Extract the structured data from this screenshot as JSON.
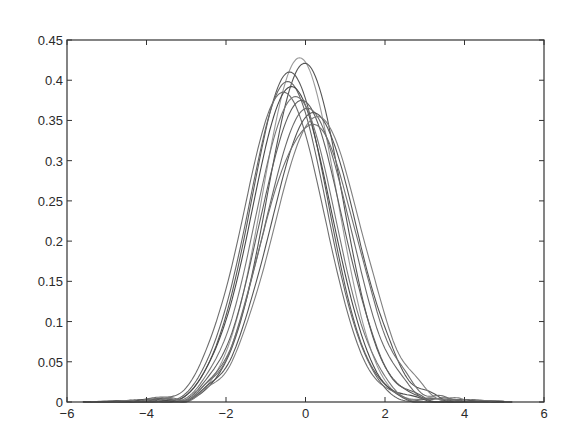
{
  "chart_data": {
    "type": "line",
    "title": "",
    "xlabel": "",
    "ylabel": "",
    "xlim": [
      -6,
      6
    ],
    "ylim": [
      0,
      0.45
    ],
    "grid": false,
    "legend": null,
    "x_ticks": [
      -6,
      -4,
      -2,
      0,
      2,
      4,
      6
    ],
    "x_tick_labels": [
      "−6",
      "−4",
      "−2",
      "0",
      "2",
      "4",
      "6"
    ],
    "y_ticks": [
      0,
      0.05,
      0.1,
      0.15,
      0.2,
      0.25,
      0.3,
      0.35,
      0.4,
      0.45
    ],
    "y_tick_labels": [
      "0",
      "0.05",
      "0.1",
      "0.15",
      "0.2",
      "0.25",
      "0.3",
      "0.35",
      "0.4",
      "0.45"
    ],
    "x": [
      -5.5,
      -5,
      -4.5,
      -4,
      -3.5,
      -3,
      -2.5,
      -2,
      -1.5,
      -1,
      -0.5,
      0,
      0.5,
      1,
      1.5,
      2,
      2.5,
      3,
      3.5,
      4,
      4.5,
      5
    ],
    "series": [
      {
        "name": "curve 1",
        "peak": 0.428,
        "mu": -0.15,
        "sigma": 0.93,
        "color": "#9a9a9a"
      },
      {
        "name": "curve 2",
        "peak": 0.421,
        "mu": -0.02,
        "sigma": 0.95,
        "color": "#555555"
      },
      {
        "name": "curve 3",
        "peak": 0.41,
        "mu": -0.4,
        "sigma": 0.97,
        "color": "#5a5a5a"
      },
      {
        "name": "curve 4",
        "peak": 0.398,
        "mu": -0.45,
        "sigma": 0.99,
        "color": "#666666"
      },
      {
        "name": "curve 5",
        "peak": 0.392,
        "mu": -0.35,
        "sigma": 1.0,
        "color": "#4a4a4a"
      },
      {
        "name": "curve 6",
        "peak": 0.385,
        "mu": -0.55,
        "sigma": 1.02,
        "color": "#6e6e6e"
      },
      {
        "name": "curve 7",
        "peak": 0.38,
        "mu": -0.25,
        "sigma": 1.0,
        "color": "#777777"
      },
      {
        "name": "curve 8",
        "peak": 0.375,
        "mu": -0.1,
        "sigma": 1.03,
        "color": "#5f5f5f"
      },
      {
        "name": "curve 9",
        "peak": 0.365,
        "mu": 0.05,
        "sigma": 1.06,
        "color": "#6a6a6a"
      },
      {
        "name": "curve 10",
        "peak": 0.36,
        "mu": 0.2,
        "sigma": 1.08,
        "color": "#555555"
      },
      {
        "name": "curve 11",
        "peak": 0.355,
        "mu": 0.3,
        "sigma": 1.1,
        "color": "#808080"
      },
      {
        "name": "curve 12",
        "peak": 0.35,
        "mu": 0.15,
        "sigma": 1.1,
        "color": "#707070",
        "shoulder": {
          "x": -0.5,
          "y": 0.315
        }
      }
    ],
    "colors": {
      "axis": "#333333",
      "curves": "#606060",
      "background": "#ffffff"
    }
  }
}
